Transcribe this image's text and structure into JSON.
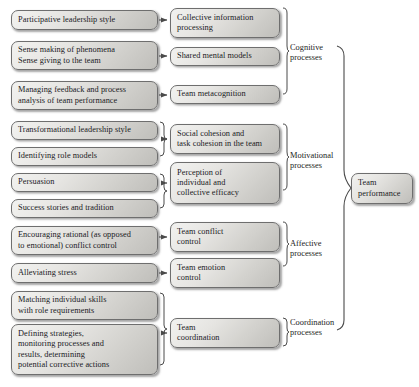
{
  "diagram": {
    "accent_color": "#6e6e6e",
    "box_fill_light": "#f2f2f0",
    "box_fill_dark": "#bfbeba",
    "outcome": {
      "lines": [
        "Team",
        "performance"
      ]
    },
    "groups": [
      {
        "id": "cognitive",
        "lines": [
          "Cognitive",
          "processes"
        ]
      },
      {
        "id": "motivational",
        "lines": [
          "Motivational",
          "processes"
        ]
      },
      {
        "id": "affective",
        "lines": [
          "Affective",
          "processes"
        ]
      },
      {
        "id": "coordination",
        "lines": [
          "Coordination",
          "processes"
        ]
      }
    ],
    "antecedents": [
      {
        "id": "participative-leadership",
        "lines": [
          "Participative leadership style"
        ]
      },
      {
        "id": "sense-making",
        "lines": [
          "Sense making of phenomena",
          "Sense giving to the team"
        ]
      },
      {
        "id": "managing-feedback",
        "lines": [
          "Managing feedback and process",
          "analysis of team performance"
        ]
      },
      {
        "id": "transformational-leadership",
        "lines": [
          "Transformational leadership style"
        ]
      },
      {
        "id": "identifying-role-models",
        "lines": [
          "Identifying role models"
        ]
      },
      {
        "id": "persuasion",
        "lines": [
          "Persuasion"
        ]
      },
      {
        "id": "success-stories",
        "lines": [
          "Success stories and tradition"
        ]
      },
      {
        "id": "encouraging-rational",
        "lines": [
          "Encouraging rational (as opposed",
          "to emotional) conflict control"
        ]
      },
      {
        "id": "alleviating-stress",
        "lines": [
          "Alleviating stress"
        ]
      },
      {
        "id": "matching-skills",
        "lines": [
          "Matching individual skills",
          "with role requirements"
        ]
      },
      {
        "id": "defining-strategies",
        "lines": [
          "Defining strategies,",
          "monitoring processes and",
          "results, determining",
          "potential corrective actions"
        ]
      }
    ],
    "processes": [
      {
        "id": "collective-information-processing",
        "group": "cognitive",
        "lines": [
          "Collective information",
          "processing"
        ]
      },
      {
        "id": "shared-mental-models",
        "group": "cognitive",
        "lines": [
          "Shared mental models"
        ]
      },
      {
        "id": "team-metacognition",
        "group": "cognitive",
        "lines": [
          "Team metacognition"
        ]
      },
      {
        "id": "social-task-cohesion",
        "group": "motivational",
        "lines": [
          "Social cohesion and",
          "task cohesion in the team"
        ]
      },
      {
        "id": "perception-of-efficacy",
        "group": "motivational",
        "lines": [
          "Perception of",
          "individual and",
          "collective efficacy"
        ]
      },
      {
        "id": "team-conflict-control",
        "group": "affective",
        "lines": [
          "Team conflict",
          "control"
        ]
      },
      {
        "id": "team-emotion-control",
        "group": "affective",
        "lines": [
          "Team emotion",
          "control"
        ]
      },
      {
        "id": "team-coordination",
        "group": "coordination",
        "lines": [
          "Team",
          "coordination"
        ]
      }
    ]
  }
}
